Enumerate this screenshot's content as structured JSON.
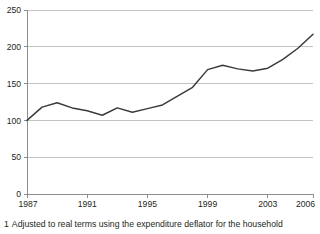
{
  "footnote": {
    "marker": "1",
    "text": "Adjusted to real terms using the expenditure deflator for the household"
  },
  "colors": {
    "line": "#3b3b3b",
    "gridline": "#a7a9ac",
    "axis": "#808285",
    "text": "#231f20",
    "background": "#ffffff"
  },
  "chart_data": {
    "type": "line",
    "title": "",
    "subtitle": "",
    "xlabel": "",
    "ylabel": "",
    "xlim": [
      1987,
      2006
    ],
    "ylim": [
      0,
      250
    ],
    "ytick_values": [
      0,
      50,
      100,
      150,
      200,
      250
    ],
    "ytick_labels": [
      "0",
      "50",
      "100",
      "150",
      "200",
      "250"
    ],
    "xtick_values": [
      1987,
      1991,
      1995,
      1999,
      2003,
      2006
    ],
    "xtick_labels": [
      "1987",
      "1991",
      "1995",
      "1999",
      "2003",
      "2006"
    ],
    "grid": "horizontal",
    "legend": "none",
    "x": [
      1987,
      1988,
      1989,
      1990,
      1991,
      1992,
      1993,
      1994,
      1995,
      1996,
      1997,
      1998,
      1999,
      2000,
      2001,
      2002,
      2003,
      2004,
      2005,
      2006
    ],
    "series": [
      {
        "name": "Index",
        "values": [
          100,
          118,
          124,
          117,
          113,
          107,
          117,
          111,
          116,
          121,
          133,
          145,
          169,
          175,
          170,
          167,
          171,
          183,
          198,
          217
        ]
      }
    ]
  }
}
